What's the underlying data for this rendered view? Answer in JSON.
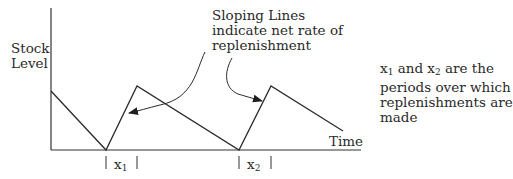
{
  "diagram": {
    "type": "inventory-sawtooth",
    "y_axis_label": [
      "Stock",
      "Level"
    ],
    "x_axis_label": "Time",
    "callout": {
      "lines": [
        "Sloping Lines",
        "indicate net rate of",
        "replenishment"
      ]
    },
    "note": {
      "lines": [
        "x1 and x2 are the",
        "periods over which",
        "replenishments are",
        "made"
      ],
      "line1": {
        "var1": "x",
        "sub1": "1",
        "mid": " and ",
        "var2": "x",
        "sub2": "2",
        "rest": " are the"
      },
      "line2": "periods over which",
      "line3": "replenishments are",
      "line4": "made"
    },
    "periods": [
      {
        "var": "x",
        "sub": "1"
      },
      {
        "var": "x",
        "sub": "2"
      }
    ],
    "stroke_color": "#2b2b2b",
    "background": "#ffffff"
  }
}
